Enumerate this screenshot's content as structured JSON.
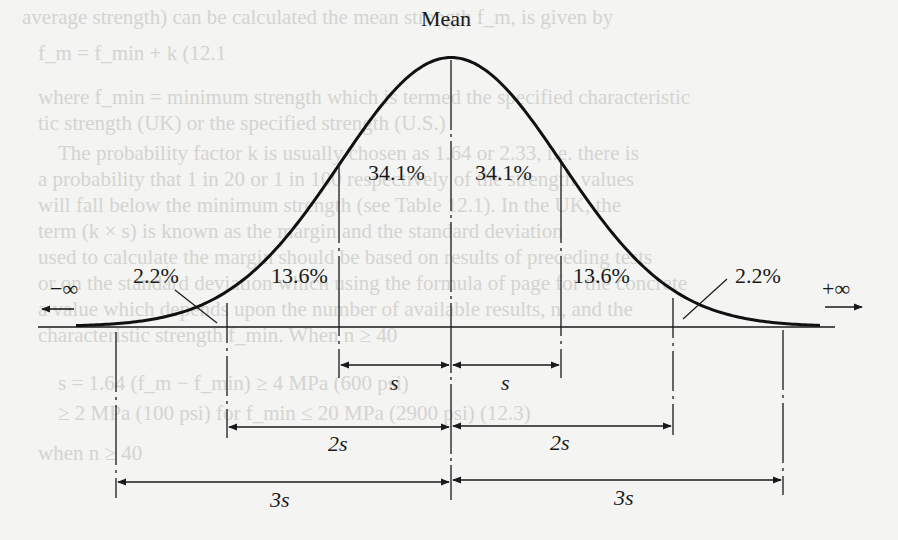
{
  "figure": {
    "type": "normal-distribution-diagram",
    "mean_label": "Mean",
    "left_infinity": "−∞",
    "right_infinity": "+∞",
    "regions": [
      {
        "id": "left-tail",
        "label": "2.2%",
        "range": "-3s to -2s"
      },
      {
        "id": "left-2s",
        "label": "13.6%",
        "range": "-2s to -1s"
      },
      {
        "id": "left-1s",
        "label": "34.1%",
        "range": "-1s to mean"
      },
      {
        "id": "right-1s",
        "label": "34.1%",
        "range": "mean to +1s"
      },
      {
        "id": "right-2s",
        "label": "13.6%",
        "range": "+1s to +2s"
      },
      {
        "id": "right-tail",
        "label": "2.2%",
        "range": "+2s to +3s"
      }
    ],
    "dimensions": {
      "one_s": "s",
      "two_s": "2s",
      "three_s": "3s"
    },
    "colors": {
      "ink": "#1a1a1a",
      "paper": "#f4f4f2",
      "bleed_text": "#cfcfcc"
    }
  },
  "bleed_through_text": [
    "average strength) can be calculated the mean strength f_m, is given by",
    "f_m = f_min + k          (12.1",
    "where f_min = minimum strength which is termed the specified characteristic",
    "tic strength (UK) or the specified strength (U.S.)",
    "The probability factor k is usually chosen as 1.64 or 2.33, i.e. there is",
    "a probability that 1 in 20 or 1 in 100 respectively of the strength values",
    "will fall below the minimum strength (see Table 12.1). In the UK, the",
    "term (k × s) is known as the margin and the standard deviation",
    "used to calculate the margin should be based on results of preceding tests",
    "or on the standard deviation which using the formula of page for the concrete",
    "a value which depends upon the number of available results, n, and the",
    "characteristic strength f_min. When n ≥ 40",
    "s = 1.64 (f_m − f_min) ≥ 4 MPa (600 psi)",
    "≥ 2 MPa (100 psi) for f_min ≤ 20 MPa (2900 psi)      (12.3)",
    "when n ≥ 40"
  ]
}
